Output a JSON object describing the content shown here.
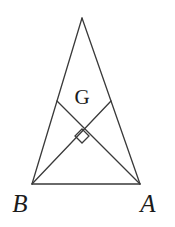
{
  "figure": {
    "kind": "geometry-diagram",
    "background_color": "#ffffff",
    "stroke_color": "#3a3a3a",
    "label_color": "#1b1b1b",
    "stroke_width": 1.3,
    "width": 175,
    "height": 227
  },
  "labels": {
    "vertex_a": "A",
    "vertex_b": "B",
    "centroid": "G"
  },
  "chart_data": {
    "type": "scatter",
    "title": "",
    "xlabel": "",
    "ylabel": "",
    "xlim": [
      0,
      175
    ],
    "ylim": [
      0,
      227
    ],
    "grid": false,
    "legend": "none",
    "points": [
      {
        "name": "C",
        "label": "",
        "x": 82,
        "y": 18
      },
      {
        "name": "B",
        "label": "B",
        "x": 32,
        "y": 184
      },
      {
        "name": "A",
        "label": "A",
        "x": 140,
        "y": 184
      },
      {
        "name": "M_left",
        "label": "",
        "x": 57,
        "y": 101
      },
      {
        "name": "M_right",
        "label": "",
        "x": 111,
        "y": 101
      },
      {
        "name": "G",
        "label": "G",
        "x": 82,
        "y": 130
      }
    ],
    "segments": [
      {
        "name": "side-CB",
        "from": "C",
        "to": "B"
      },
      {
        "name": "side-CA",
        "from": "C",
        "to": "A"
      },
      {
        "name": "base-BA",
        "from": "B",
        "to": "A"
      },
      {
        "name": "median-A-to-Mleft",
        "from": "A",
        "to": "M_left"
      },
      {
        "name": "median-B-to-Mright",
        "from": "B",
        "to": "M_right"
      }
    ],
    "markers": [
      {
        "name": "right-angle-marker",
        "shape": "diamond",
        "at_point": "G",
        "center_x": 82,
        "center_y": 136,
        "half_size": 7
      }
    ],
    "label_positions": [
      {
        "text": "G",
        "x": 82,
        "y": 97
      },
      {
        "text": "B",
        "x": 20,
        "y": 203
      },
      {
        "text": "A",
        "x": 148,
        "y": 203
      }
    ]
  }
}
